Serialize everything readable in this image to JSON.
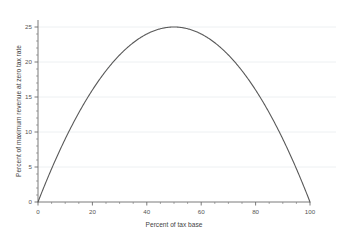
{
  "chart_data": {
    "type": "line",
    "title": "",
    "subtitle": "",
    "xlabel": "Percent of tax base",
    "ylabel": "Percent of maximum revenue at zero tax rate",
    "xlim": [
      0,
      100
    ],
    "ylim": [
      0,
      26
    ],
    "grid": true,
    "grid_axis": "y",
    "legend": false,
    "legend_position": "none",
    "annotations": [],
    "x_ticks": [
      0,
      20,
      40,
      60,
      80,
      100
    ],
    "x_tick_labels": [
      "0",
      "20",
      "40",
      "60",
      "80",
      "100"
    ],
    "x_minor_tick_interval": 5,
    "y_ticks": [
      0,
      5,
      10,
      15,
      20,
      25
    ],
    "y_tick_labels": [
      "0",
      "5",
      "10",
      "15",
      "20",
      "25"
    ],
    "y_minor_tick_interval": 1,
    "curve_color": "#595959",
    "grid_color": "#e9ecef",
    "axis_color": "#6b6b6b",
    "background_color": "#ffffff",
    "series": [
      {
        "name": "Revenue curve",
        "formula": "y = x * (100 - x) / 100",
        "x": [
          0,
          2,
          4,
          6,
          8,
          10,
          12,
          14,
          16,
          18,
          20,
          22,
          24,
          26,
          28,
          30,
          32,
          34,
          36,
          38,
          40,
          42,
          44,
          46,
          48,
          50,
          52,
          54,
          56,
          58,
          60,
          62,
          64,
          66,
          68,
          70,
          72,
          74,
          76,
          78,
          80,
          82,
          84,
          86,
          88,
          90,
          92,
          94,
          96,
          98,
          100
        ],
        "values": [
          0,
          1.96,
          3.84,
          5.64,
          7.36,
          9,
          10.56,
          12.04,
          13.44,
          14.76,
          16,
          17.16,
          18.24,
          19.24,
          20.16,
          21,
          21.76,
          22.44,
          23.04,
          23.56,
          24,
          24.36,
          24.64,
          24.84,
          24.96,
          25,
          24.96,
          24.84,
          24.64,
          24.36,
          24,
          23.56,
          23.04,
          22.44,
          21.76,
          21,
          20.16,
          19.24,
          18.24,
          17.16,
          16,
          14.76,
          13.44,
          12.04,
          10.56,
          9,
          7.36,
          5.64,
          3.84,
          1.96,
          0
        ]
      }
    ],
    "peak": {
      "x": 50,
      "y": 25
    }
  }
}
